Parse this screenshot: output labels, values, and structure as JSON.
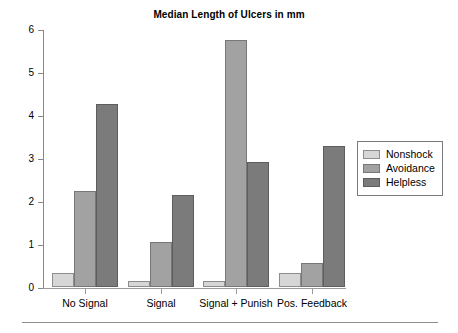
{
  "chart_data": {
    "type": "bar",
    "title": "Median Length of Ulcers in mm",
    "xlabel": "",
    "ylabel": "",
    "ylim": [
      0,
      6
    ],
    "yticks": [
      0,
      1,
      2,
      3,
      4,
      5,
      6
    ],
    "ytick_labels": [
      "0",
      "1",
      "2",
      "3",
      "4",
      "5",
      "6"
    ],
    "grid": false,
    "legend_position": "right",
    "categories": [
      "No Signal",
      "Signal",
      "Signal + Punish",
      "Pos. Feedback"
    ],
    "series": [
      {
        "name": "Nonshock",
        "color": "#d6d6d6",
        "values": [
          0.33,
          0.15,
          0.15,
          0.33
        ]
      },
      {
        "name": "Avoidance",
        "color": "#a2a2a2",
        "values": [
          2.23,
          1.05,
          5.74,
          0.57
        ]
      },
      {
        "name": "Helpless",
        "color": "#7b7b7b",
        "values": [
          4.25,
          2.15,
          2.9,
          3.27
        ]
      }
    ]
  },
  "colors": {
    "axis": "#8e8e8e",
    "text": "#000000",
    "background": "#ffffff"
  }
}
